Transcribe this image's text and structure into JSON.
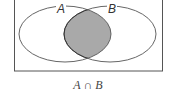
{
  "diagram": {
    "type": "venn",
    "sets": [
      {
        "label": "A"
      },
      {
        "label": "B"
      }
    ],
    "highlighted_region": "intersection",
    "caption": {
      "left": "A",
      "operator": "∩",
      "right": "B"
    },
    "colors": {
      "frame": "#555555",
      "outline": "#555555",
      "fill": "#a9a9a9",
      "background": "#ffffff"
    }
  }
}
